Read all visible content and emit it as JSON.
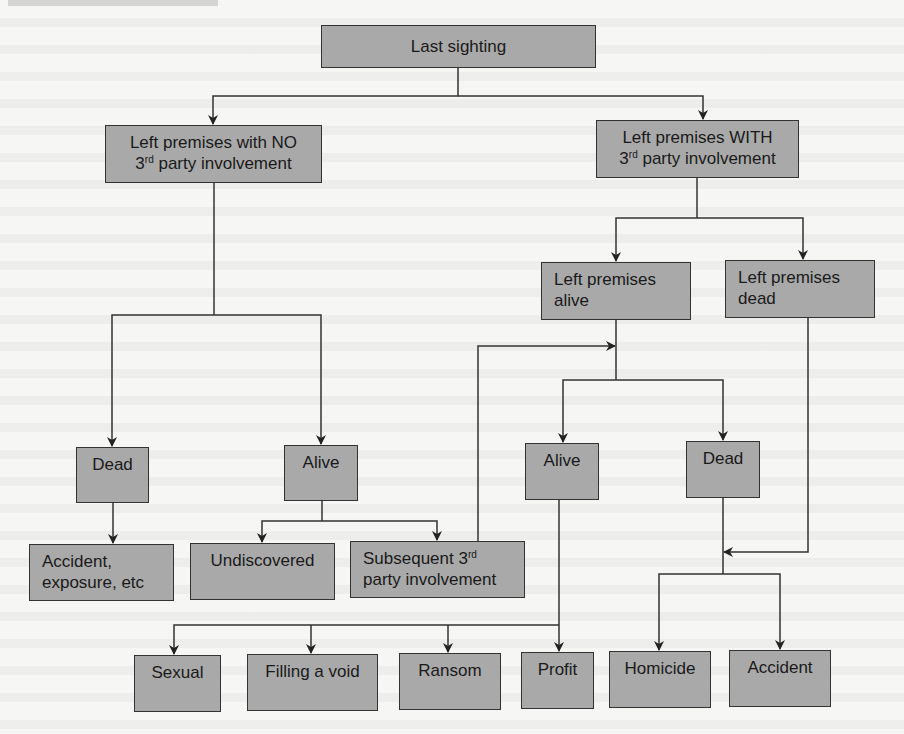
{
  "diagram": {
    "type": "flowchart",
    "background_color": "#f6f6f4",
    "node_fill_color": "#a9a9a9",
    "line_color": "#333333",
    "nodes": {
      "last_sighting": {
        "label": "Last sighting"
      },
      "left_no_3rd": {
        "line1": "Left premises with NO",
        "line2_sup": "rd",
        "line2_pre": "3",
        "line2_post": " party involvement"
      },
      "left_with_3rd": {
        "line1": "Left premises WITH",
        "line2_pre": "3",
        "line2_sup": "rd",
        "line2_post": " party involvement"
      },
      "left_alive": {
        "line1": "Left premises",
        "line2": "alive"
      },
      "left_dead": {
        "line1": "Left premises",
        "line2": "dead"
      },
      "dead_left": {
        "label": "Dead"
      },
      "alive_left": {
        "label": "Alive"
      },
      "alive_right": {
        "label": "Alive"
      },
      "dead_right": {
        "label": "Dead"
      },
      "accident_exposure": {
        "line1": "Accident,",
        "line2": "exposure, etc"
      },
      "undiscovered": {
        "label": "Undiscovered"
      },
      "subsequent_3rd": {
        "line1_pre": "Subsequent 3",
        "line1_sup": "rd",
        "line2": "party involvement"
      },
      "sexual": {
        "label": "Sexual"
      },
      "filling_void": {
        "label": "Filling a void"
      },
      "ransom": {
        "label": "Ransom"
      },
      "profit": {
        "label": "Profit"
      },
      "homicide": {
        "label": "Homicide"
      },
      "accident": {
        "label": "Accident"
      }
    },
    "edges": [
      {
        "from": "Last sighting",
        "to": "Left premises with NO 3rd party involvement"
      },
      {
        "from": "Last sighting",
        "to": "Left premises WITH 3rd party involvement"
      },
      {
        "from": "Left premises with NO 3rd party involvement",
        "to": "Dead"
      },
      {
        "from": "Left premises with NO 3rd party involvement",
        "to": "Alive"
      },
      {
        "from": "Left premises WITH 3rd party involvement",
        "to": "Left premises alive"
      },
      {
        "from": "Left premises WITH 3rd party involvement",
        "to": "Left premises dead"
      },
      {
        "from": "Dead",
        "to": "Accident, exposure, etc"
      },
      {
        "from": "Alive",
        "to": "Undiscovered"
      },
      {
        "from": "Alive",
        "to": "Subsequent 3rd party involvement"
      },
      {
        "from": "Subsequent 3rd party involvement",
        "to": "Left premises alive (trunk)"
      },
      {
        "from": "Left premises alive",
        "to": "Alive (right)"
      },
      {
        "from": "Left premises alive",
        "to": "Dead (right)"
      },
      {
        "from": "Alive (right)",
        "to": "Sexual"
      },
      {
        "from": "Alive (right)",
        "to": "Filling a void"
      },
      {
        "from": "Alive (right)",
        "to": "Ransom"
      },
      {
        "from": "Alive (right)",
        "to": "Profit"
      },
      {
        "from": "Left premises dead",
        "to": "Dead (right) trunk"
      },
      {
        "from": "Dead (right)",
        "to": "Homicide"
      },
      {
        "from": "Dead (right)",
        "to": "Accident"
      }
    ]
  }
}
